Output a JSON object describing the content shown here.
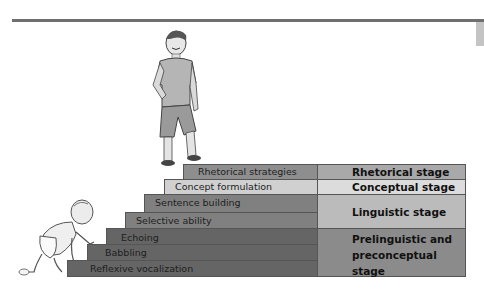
{
  "diagram": {
    "steps": [
      {
        "label": "Rhetorical strategies",
        "stage": "rhetorical"
      },
      {
        "label": "Concept formulation",
        "stage": "conceptual"
      },
      {
        "label": "Sentence building",
        "stage": "linguistic"
      },
      {
        "label": "Selective ability",
        "stage": "linguistic"
      },
      {
        "label": "Echoing",
        "stage": "prelinguistic"
      },
      {
        "label": "Babbling",
        "stage": "prelinguistic"
      },
      {
        "label": "Reflexive vocalization",
        "stage": "prelinguistic"
      }
    ],
    "stages": [
      {
        "label": "Rhetorical stage",
        "color": "#a9a9a9"
      },
      {
        "label": "Conceptual stage",
        "color": "#dcdcdc"
      },
      {
        "label": "Linguistic stage",
        "color": "#bbbbbb"
      },
      {
        "label": "Prelinguistic and preconceptual stage",
        "lines": [
          "Prelinguistic and",
          "preconceptual",
          "stage"
        ],
        "color": "#8b8b8b"
      }
    ],
    "step_colors": {
      "rhetorical": "#8e8e8e",
      "conceptual": "#d0d0d0",
      "linguistic": "#808080",
      "prelinguistic": "#656565"
    },
    "figures": {
      "top": "boy-standing-on-top-step",
      "bottom": "baby-crawling-up-steps"
    }
  }
}
